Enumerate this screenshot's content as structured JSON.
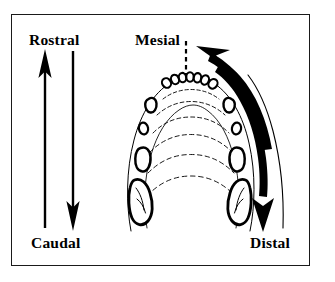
{
  "figure": {
    "background_color": "#ffffff",
    "ink_color": "#000000",
    "frame": {
      "border_color": "#1a1a1a",
      "border_width_px": 1.5
    }
  },
  "labels": {
    "rostral": "Rostral",
    "caudal": "Caudal",
    "mesial": "Mesial",
    "distal": "Distal"
  },
  "arrows": {
    "rostral": {
      "name": "rostral-arrow",
      "direction": "up",
      "style": "straight",
      "description": "Straight vertical arrow pointing upward toward the Rostral label"
    },
    "caudal": {
      "name": "caudal-arrow",
      "direction": "down",
      "style": "straight",
      "description": "Straight vertical arrow pointing downward toward the Caudal label"
    },
    "mesial": {
      "name": "mesial-arrow",
      "direction": "counterclockwise-up-left",
      "style": "curved-tapered",
      "description": "Thick curved arrow sweeping along the dental arch toward the Mesial label"
    },
    "distal": {
      "name": "distal-arrow",
      "direction": "clockwise-down",
      "style": "curved-tapered",
      "description": "Thick curved arrow sweeping along the dental arch toward the Distal label"
    }
  },
  "anatomy": {
    "structure": "mandibular dental arch, occlusal view",
    "midline": {
      "name": "midline",
      "style": "dashed",
      "orientation": "vertical"
    },
    "teeth": {
      "incisors_count": 7,
      "canines_count": 2,
      "premolars_per_side": 2,
      "molars_per_side": 1
    },
    "rugae_arc_count": 6
  }
}
